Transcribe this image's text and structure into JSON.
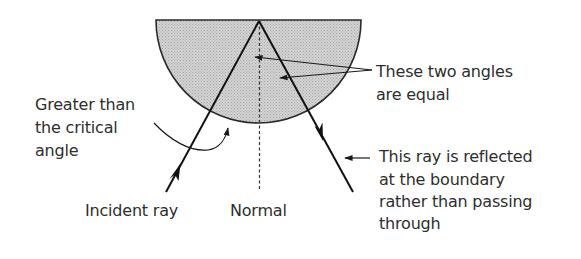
{
  "diagram": {
    "topic": "Total internal reflection in a semicircular block",
    "colors": {
      "block_fill": "#c9c9c9",
      "line": "#1a1a1a",
      "text": "#2e2e2e",
      "background": "#ffffff"
    },
    "labels": {
      "critical_angle": {
        "lines": [
          "Greater than",
          "the critical",
          "angle"
        ]
      },
      "equal_angles": {
        "lines": [
          "These two angles",
          "are equal"
        ]
      },
      "reflected_ray": {
        "lines": [
          "This ray is reflected",
          "at the boundary",
          "rather than passing",
          "through"
        ]
      },
      "incident_ray": "Incident ray",
      "normal": "Normal"
    },
    "elements": {
      "semicircle_block": "semicircular glass block (shaded)",
      "normal_line": "dashed vertical line",
      "incident_ray": "ray travelling up to the flat surface",
      "reflected_ray": "ray travelling down after reflection"
    }
  }
}
